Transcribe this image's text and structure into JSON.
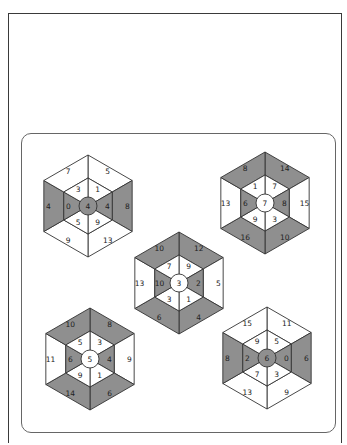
{
  "colors": {
    "shade": "#8f8f8f",
    "line": "#333333",
    "white": "#ffffff"
  },
  "puzzles": [
    {
      "id": "top-left",
      "cx": 88,
      "cy": 206,
      "center": "4",
      "center_shaded": true,
      "outer": [
        "5",
        "8",
        "13",
        "9",
        "4",
        "7"
      ],
      "outer_shaded": [
        false,
        true,
        false,
        false,
        true,
        false
      ],
      "inner": [
        "1",
        "4",
        "9",
        "5",
        "0",
        "3"
      ],
      "inner_shaded": [
        false,
        true,
        false,
        false,
        true,
        false
      ]
    },
    {
      "id": "top-right",
      "cx": 265,
      "cy": 203,
      "center": "7",
      "center_shaded": false,
      "outer": [
        "14",
        "15",
        "10",
        "16",
        "13",
        "8"
      ],
      "outer_shaded": [
        true,
        false,
        true,
        true,
        false,
        true
      ],
      "inner": [
        "7",
        "8",
        "3",
        "9",
        "6",
        "1"
      ],
      "inner_shaded": [
        false,
        true,
        false,
        false,
        true,
        false
      ]
    },
    {
      "id": "middle",
      "cx": 179,
      "cy": 283,
      "center": "3",
      "center_shaded": false,
      "outer": [
        "12",
        "5",
        "4",
        "6",
        "13",
        "10"
      ],
      "outer_shaded": [
        true,
        false,
        true,
        true,
        false,
        true
      ],
      "inner": [
        "9",
        "2",
        "1",
        "3",
        "10",
        "7"
      ],
      "inner_shaded": [
        false,
        true,
        false,
        false,
        true,
        false
      ]
    },
    {
      "id": "bottom-left",
      "cx": 90,
      "cy": 359,
      "center": "5",
      "center_shaded": false,
      "outer": [
        "8",
        "9",
        "6",
        "14",
        "11",
        "10"
      ],
      "outer_shaded": [
        true,
        false,
        true,
        true,
        false,
        true
      ],
      "inner": [
        "3",
        "4",
        "1",
        "9",
        "6",
        "5"
      ],
      "inner_shaded": [
        false,
        true,
        false,
        false,
        true,
        false
      ]
    },
    {
      "id": "bottom-right",
      "cx": 267,
      "cy": 358,
      "center": "6",
      "center_shaded": true,
      "outer": [
        "11",
        "6",
        "9",
        "13",
        "8",
        "15"
      ],
      "outer_shaded": [
        false,
        true,
        false,
        false,
        true,
        false
      ],
      "inner": [
        "5",
        "0",
        "3",
        "7",
        "2",
        "9"
      ],
      "inner_shaded": [
        false,
        true,
        false,
        false,
        true,
        false
      ]
    }
  ]
}
